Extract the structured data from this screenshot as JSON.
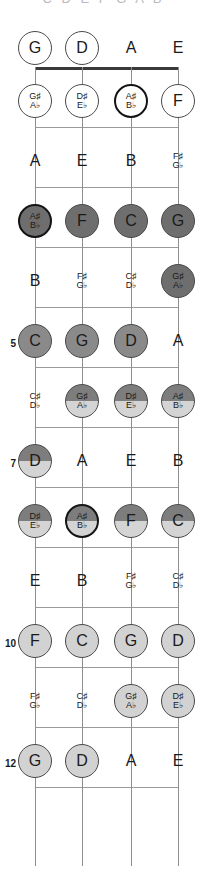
{
  "header_clipped_text": "C D E F G A B",
  "instrument": {
    "type": "bass-guitar",
    "string_count": 4,
    "fret_count": 12,
    "tuning": [
      "G",
      "D",
      "A",
      "E"
    ]
  },
  "geometry": {
    "string_x": [
      35,
      82,
      131,
      178
    ],
    "nut_y": 67,
    "fret_spacing": 60,
    "open_label_y": 48,
    "first_note_y": 101,
    "board_width": 207,
    "board_height": 888,
    "nut_left": 35,
    "nut_right": 178,
    "last_fret_y": 866
  },
  "colors": {
    "background": "#ffffff",
    "string": "#8d8d8d",
    "fret": "#9a9a9a",
    "nut": "#3a3a3a",
    "text": "#1a1a1a",
    "circle_white": "#ffffff",
    "circle_light": "#d2d2d2",
    "circle_mid": "#8a8a8a",
    "circle_dark": "#6e6e6e",
    "circle_split_top": "#7d7d7d",
    "circle_split_bottom": "#d4d4d4",
    "circle_border": "#4a4a4a",
    "root_border": "#141414",
    "fretnum": "#1a1a1a",
    "header_faint": "#b9b9c0"
  },
  "fret_markers": [
    {
      "fret": 5,
      "label": "5"
    },
    {
      "fret": 7,
      "label": "7"
    },
    {
      "fret": 10,
      "label": "10"
    },
    {
      "fret": 12,
      "label": "12"
    }
  ],
  "rows": [
    {
      "fret": 0,
      "label": "open",
      "notes": [
        {
          "string": 0,
          "nat": "G",
          "sharp": "",
          "flat": "",
          "style": "circ white"
        },
        {
          "string": 1,
          "nat": "D",
          "sharp": "",
          "flat": "",
          "style": "circ white"
        },
        {
          "string": 2,
          "nat": "A",
          "sharp": "",
          "flat": "",
          "style": "plain"
        },
        {
          "string": 3,
          "nat": "E",
          "sharp": "",
          "flat": "",
          "style": "plain"
        }
      ]
    },
    {
      "fret": 1,
      "label": "1",
      "notes": [
        {
          "string": 0,
          "nat": "",
          "sharp": "G♯",
          "flat": "A♭",
          "style": "circ white"
        },
        {
          "string": 1,
          "nat": "",
          "sharp": "D♯",
          "flat": "E♭",
          "style": "circ white"
        },
        {
          "string": 2,
          "nat": "",
          "sharp": "A♯",
          "flat": "B♭",
          "style": "circ white root"
        },
        {
          "string": 3,
          "nat": "F",
          "sharp": "",
          "flat": "",
          "style": "circ white"
        }
      ]
    },
    {
      "fret": 2,
      "label": "2",
      "notes": [
        {
          "string": 0,
          "nat": "A",
          "sharp": "",
          "flat": "",
          "style": "plain"
        },
        {
          "string": 1,
          "nat": "E",
          "sharp": "",
          "flat": "",
          "style": "plain"
        },
        {
          "string": 2,
          "nat": "B",
          "sharp": "",
          "flat": "",
          "style": "plain"
        },
        {
          "string": 3,
          "nat": "",
          "sharp": "F♯",
          "flat": "G♭",
          "style": "plain"
        }
      ]
    },
    {
      "fret": 3,
      "label": "3",
      "notes": [
        {
          "string": 0,
          "nat": "",
          "sharp": "A♯",
          "flat": "B♭",
          "style": "circ dark root"
        },
        {
          "string": 1,
          "nat": "F",
          "sharp": "",
          "flat": "",
          "style": "circ dark"
        },
        {
          "string": 2,
          "nat": "C",
          "sharp": "",
          "flat": "",
          "style": "circ dark"
        },
        {
          "string": 3,
          "nat": "G",
          "sharp": "",
          "flat": "",
          "style": "circ dark"
        }
      ]
    },
    {
      "fret": 4,
      "label": "4",
      "notes": [
        {
          "string": 0,
          "nat": "B",
          "sharp": "",
          "flat": "",
          "style": "plain"
        },
        {
          "string": 1,
          "nat": "",
          "sharp": "F♯",
          "flat": "G♭",
          "style": "plain"
        },
        {
          "string": 2,
          "nat": "",
          "sharp": "C♯",
          "flat": "D♭",
          "style": "plain"
        },
        {
          "string": 3,
          "nat": "",
          "sharp": "G♯",
          "flat": "A♭",
          "style": "circ dark"
        }
      ]
    },
    {
      "fret": 5,
      "label": "5",
      "notes": [
        {
          "string": 0,
          "nat": "C",
          "sharp": "",
          "flat": "",
          "style": "circ mid"
        },
        {
          "string": 1,
          "nat": "G",
          "sharp": "",
          "flat": "",
          "style": "circ mid"
        },
        {
          "string": 2,
          "nat": "D",
          "sharp": "",
          "flat": "",
          "style": "circ mid"
        },
        {
          "string": 3,
          "nat": "A",
          "sharp": "",
          "flat": "",
          "style": "plain"
        }
      ]
    },
    {
      "fret": 6,
      "label": "6",
      "notes": [
        {
          "string": 0,
          "nat": "",
          "sharp": "C♯",
          "flat": "D♭",
          "style": "plain"
        },
        {
          "string": 1,
          "nat": "",
          "sharp": "G♯",
          "flat": "A♭",
          "style": "circ split"
        },
        {
          "string": 2,
          "nat": "",
          "sharp": "D♯",
          "flat": "E♭",
          "style": "circ split"
        },
        {
          "string": 3,
          "nat": "",
          "sharp": "A♯",
          "flat": "B♭",
          "style": "circ split"
        }
      ]
    },
    {
      "fret": 7,
      "label": "7",
      "notes": [
        {
          "string": 0,
          "nat": "D",
          "sharp": "",
          "flat": "",
          "style": "circ split"
        },
        {
          "string": 1,
          "nat": "A",
          "sharp": "",
          "flat": "",
          "style": "plain"
        },
        {
          "string": 2,
          "nat": "E",
          "sharp": "",
          "flat": "",
          "style": "plain"
        },
        {
          "string": 3,
          "nat": "B",
          "sharp": "",
          "flat": "",
          "style": "plain"
        }
      ]
    },
    {
      "fret": 8,
      "label": "8",
      "notes": [
        {
          "string": 0,
          "nat": "",
          "sharp": "D♯",
          "flat": "E♭",
          "style": "circ split"
        },
        {
          "string": 1,
          "nat": "",
          "sharp": "A♯",
          "flat": "B♭",
          "style": "circ split root"
        },
        {
          "string": 2,
          "nat": "F",
          "sharp": "",
          "flat": "",
          "style": "circ split"
        },
        {
          "string": 3,
          "nat": "C",
          "sharp": "",
          "flat": "",
          "style": "circ split"
        }
      ]
    },
    {
      "fret": 9,
      "label": "9",
      "notes": [
        {
          "string": 0,
          "nat": "E",
          "sharp": "",
          "flat": "",
          "style": "plain"
        },
        {
          "string": 1,
          "nat": "B",
          "sharp": "",
          "flat": "",
          "style": "plain"
        },
        {
          "string": 2,
          "nat": "",
          "sharp": "F♯",
          "flat": "G♭",
          "style": "plain"
        },
        {
          "string": 3,
          "nat": "",
          "sharp": "C♯",
          "flat": "D♭",
          "style": "plain"
        }
      ]
    },
    {
      "fret": 10,
      "label": "10",
      "notes": [
        {
          "string": 0,
          "nat": "F",
          "sharp": "",
          "flat": "",
          "style": "circ light"
        },
        {
          "string": 1,
          "nat": "C",
          "sharp": "",
          "flat": "",
          "style": "circ light"
        },
        {
          "string": 2,
          "nat": "G",
          "sharp": "",
          "flat": "",
          "style": "circ light"
        },
        {
          "string": 3,
          "nat": "D",
          "sharp": "",
          "flat": "",
          "style": "circ light"
        }
      ]
    },
    {
      "fret": 11,
      "label": "11",
      "notes": [
        {
          "string": 0,
          "nat": "",
          "sharp": "F♯",
          "flat": "G♭",
          "style": "plain"
        },
        {
          "string": 1,
          "nat": "",
          "sharp": "C♯",
          "flat": "D♭",
          "style": "plain"
        },
        {
          "string": 2,
          "nat": "",
          "sharp": "G♯",
          "flat": "A♭",
          "style": "circ light"
        },
        {
          "string": 3,
          "nat": "",
          "sharp": "D♯",
          "flat": "E♭",
          "style": "circ light"
        }
      ]
    },
    {
      "fret": 12,
      "label": "12",
      "notes": [
        {
          "string": 0,
          "nat": "G",
          "sharp": "",
          "flat": "",
          "style": "circ light"
        },
        {
          "string": 1,
          "nat": "D",
          "sharp": "",
          "flat": "",
          "style": "circ light"
        },
        {
          "string": 2,
          "nat": "A",
          "sharp": "",
          "flat": "",
          "style": "plain"
        },
        {
          "string": 3,
          "nat": "E",
          "sharp": "",
          "flat": "",
          "style": "plain"
        }
      ]
    }
  ]
}
